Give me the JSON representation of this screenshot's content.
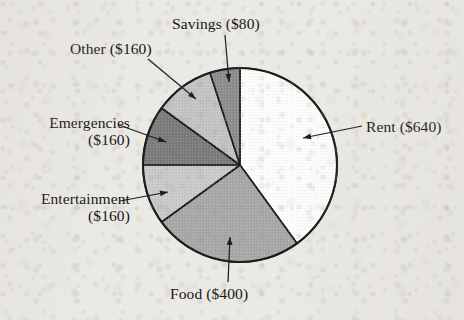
{
  "chart_data": {
    "type": "pie",
    "title": "",
    "subtitle": "",
    "xlabel": "",
    "ylabel": "",
    "legend_position": "none",
    "grid": false,
    "currency": "$",
    "total": 1600,
    "start_angle_deg": 0,
    "direction": "clockwise",
    "center": {
      "x": 240,
      "y": 165
    },
    "radius": 97,
    "categories": [
      "Rent",
      "Food",
      "Entertainment",
      "Emergencies",
      "Other",
      "Savings"
    ],
    "values": [
      640,
      400,
      160,
      160,
      160,
      80
    ],
    "slices": [
      {
        "name": "Rent",
        "amount": 640,
        "label": "Rent ($640)",
        "percent": 40,
        "start_deg": 0,
        "end_deg": 144,
        "color": "#fdfcfa",
        "label_pos": {
          "x": 366,
          "y": 118
        },
        "leader": {
          "x1": 362,
          "y1": 126,
          "x2": 303,
          "y2": 138
        }
      },
      {
        "name": "Food",
        "amount": 400,
        "label": "Food ($400)",
        "percent": 25,
        "start_deg": 144,
        "end_deg": 234,
        "color": "#a8a8a8",
        "label_pos": {
          "x": 170,
          "y": 285
        },
        "leader": {
          "x1": 228,
          "y1": 282,
          "x2": 230,
          "y2": 237
        }
      },
      {
        "name": "Entertainment",
        "amount": 160,
        "label": "Entertainment\n($160)",
        "percent": 10,
        "start_deg": 234,
        "end_deg": 270,
        "color": "#c9c9c9",
        "label_pos": {
          "x": 2,
          "y": 190
        },
        "leader": {
          "x1": 120,
          "y1": 201,
          "x2": 168,
          "y2": 192
        }
      },
      {
        "name": "Emergencies",
        "amount": 160,
        "label": "Emergencies\n($160)",
        "percent": 10,
        "start_deg": 270,
        "end_deg": 306,
        "color": "#7b7b7b",
        "label_pos": {
          "x": 10,
          "y": 114
        },
        "leader": {
          "x1": 119,
          "y1": 125,
          "x2": 166,
          "y2": 142
        }
      },
      {
        "name": "Other",
        "amount": 160,
        "label": "Other ($160)",
        "percent": 10,
        "start_deg": 306,
        "end_deg": 342,
        "color": "#c3c3c3",
        "label_pos": {
          "x": 70,
          "y": 40
        },
        "leader": {
          "x1": 148,
          "y1": 59,
          "x2": 196,
          "y2": 99
        }
      },
      {
        "name": "Savings",
        "amount": 80,
        "label": "Savings ($80)",
        "percent": 5,
        "start_deg": 342,
        "end_deg": 360,
        "color": "#8d8d8d",
        "label_pos": {
          "x": 172,
          "y": 15
        },
        "leader": {
          "x1": 225,
          "y1": 35,
          "x2": 229,
          "y2": 82
        }
      }
    ],
    "stroke_color": "#1d1d1d",
    "background": "#ebe9e4"
  },
  "labels": {
    "rent": "Rent ($640)",
    "food": "Food ($400)",
    "entertainment_line1": "Entertainment",
    "entertainment_line2": "($160)",
    "emergencies_line1": "Emergencies",
    "emergencies_line2": "($160)",
    "other": "Other ($160)",
    "savings": "Savings ($80)"
  }
}
